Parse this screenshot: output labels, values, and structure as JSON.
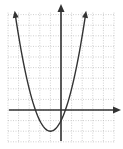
{
  "chart_data": {
    "type": "line",
    "title": "",
    "xlabel": "",
    "ylabel": "",
    "xlim": [
      -5,
      5
    ],
    "ylim": [
      -3,
      9
    ],
    "grid": true,
    "legend": null,
    "series": [
      {
        "name": "parabola",
        "equation": "y = (x + 1)^2 - 2",
        "vertex": [
          -1,
          -2
        ],
        "roots": [
          -2.41,
          0.41
        ],
        "x": [
          -4.3,
          -4,
          -3,
          -2,
          -1,
          0,
          1,
          2,
          2.3
        ],
        "values": [
          8.9,
          7,
          2,
          -1,
          -2,
          -1,
          2,
          7,
          8.9
        ]
      }
    ]
  },
  "colors": {
    "curve": "#333333",
    "axes": "#333333",
    "grid": "#bbbbbb",
    "background": "#ffffff"
  }
}
